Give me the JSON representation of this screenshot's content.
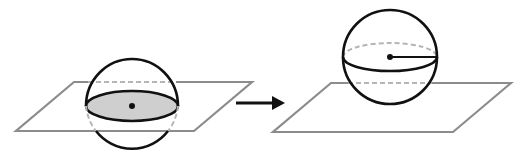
{
  "diagram": {
    "colors": {
      "background": "#ffffff",
      "stroke": "#111111",
      "plane": "#8c8c8c",
      "hidden": "#b5b5b5",
      "cross_section_fill": "#cfcfcf"
    },
    "left_figure": {
      "plane": [
        [
          74,
          82
        ],
        [
          252,
          82
        ],
        [
          194,
          131
        ],
        [
          16,
          131
        ]
      ],
      "sphere": {
        "cx": 132,
        "cy": 106,
        "r": 47
      },
      "cross_section": {
        "cx": 132,
        "cy": 106,
        "rx": 46,
        "ry": 15
      },
      "center_dot": {
        "cx": 132,
        "cy": 106
      }
    },
    "arrow": {
      "x1": 236,
      "y1": 103,
      "x2": 284,
      "y2": 103
    },
    "right_figure": {
      "plane": [
        [
          331,
          83
        ],
        [
          511,
          83
        ],
        [
          453,
          132
        ],
        [
          273,
          132
        ]
      ],
      "sphere": {
        "cx": 390,
        "cy": 57,
        "r": 47
      },
      "equator": {
        "cx": 390,
        "cy": 57,
        "rx": 47,
        "ry": 14
      },
      "center_dot": {
        "cx": 390,
        "cy": 57
      },
      "radius_line": {
        "x1": 390,
        "y1": 57,
        "x2": 437,
        "y2": 57
      }
    }
  }
}
